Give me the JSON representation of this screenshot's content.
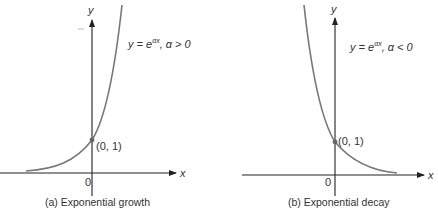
{
  "figure": {
    "panels": [
      {
        "id": "a",
        "caption": "(a)  Exponential growth",
        "equation": "y = e",
        "exponent": "αx",
        "condition": ", α > 0",
        "point_label": "(0, 1)",
        "origin_label": "0",
        "x_axis_label": "x",
        "y_axis_label": "y"
      },
      {
        "id": "b",
        "caption": "(b)  Exponential decay",
        "equation": "y = e",
        "exponent": "αx",
        "condition": ", α < 0",
        "point_label": "(0, 1)",
        "origin_label": "0",
        "x_axis_label": "x",
        "y_axis_label": "y"
      }
    ],
    "colors": {
      "axis": "#222222",
      "curve": "#777777",
      "text": "#333333"
    }
  }
}
